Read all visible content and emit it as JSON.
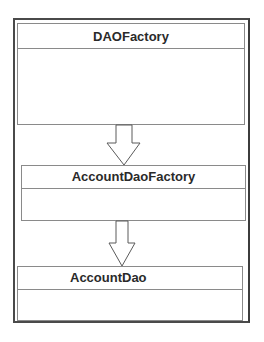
{
  "diagram": {
    "type": "class-hierarchy",
    "classes": [
      {
        "id": "c1",
        "name": "DAOFactory"
      },
      {
        "id": "c2",
        "name": "AccountDaoFactory"
      },
      {
        "id": "c3",
        "name": "AccountDao"
      }
    ],
    "arrows": [
      {
        "from": "DAOFactory",
        "to": "AccountDaoFactory",
        "style": "hollow-block-arrow"
      },
      {
        "from": "AccountDaoFactory",
        "to": "AccountDao",
        "style": "hollow-block-arrow"
      }
    ],
    "colors": {
      "frame": "#4a4a4a",
      "box_border": "#8a8a8a",
      "text": "#2a2a2a",
      "background": "#ffffff"
    }
  }
}
